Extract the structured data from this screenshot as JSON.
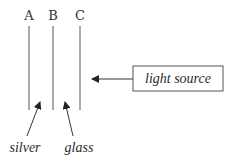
{
  "diagram": {
    "lines": [
      {
        "label": "A",
        "x": 29
      },
      {
        "label": "B",
        "x": 53
      },
      {
        "label": "C",
        "x": 80
      }
    ],
    "box": {
      "label": "light source"
    },
    "annotations": [
      {
        "label": "silver"
      },
      {
        "label": "glass"
      }
    ],
    "colors": {
      "stroke": "#555555",
      "text": "#333333",
      "background": "#ffffff"
    }
  }
}
